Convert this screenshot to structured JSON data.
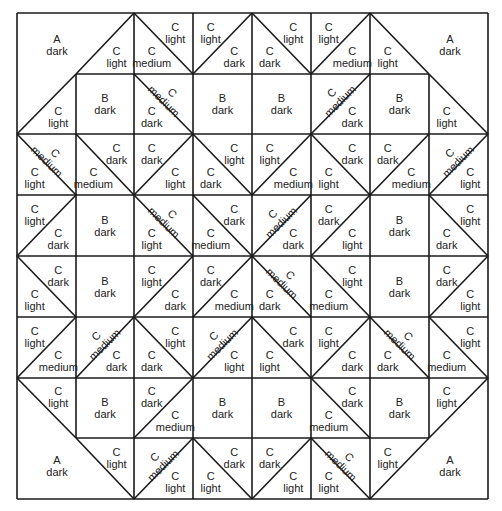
{
  "colors": {
    "line": "#1a1a1a",
    "text": "#222222",
    "background": "#ffffff"
  },
  "grid": {
    "cols": [
      17,
      76,
      134,
      193,
      252,
      311,
      370,
      429,
      488
    ],
    "rows": [
      13,
      74,
      134,
      195,
      256,
      317,
      378,
      438,
      499
    ]
  },
  "corners": [
    {
      "name": "top-left",
      "patch": "A",
      "shade": "dark",
      "x": 57,
      "y": 45
    },
    {
      "name": "top-right",
      "patch": "A",
      "shade": "dark",
      "x": 450,
      "y": 45
    },
    {
      "name": "bottom-left",
      "patch": "A",
      "shade": "dark",
      "x": 57,
      "y": 466
    },
    {
      "name": "bottom-right",
      "patch": "A",
      "shade": "dark",
      "x": 450,
      "y": 466
    }
  ],
  "cells": [
    {
      "r": 0,
      "c": 1,
      "diag": "/",
      "outer": true,
      "labels": [
        {
          "pos": "br",
          "shade": "light"
        }
      ]
    },
    {
      "r": 0,
      "c": 2,
      "diag": "\\",
      "labels": [
        {
          "pos": "tr",
          "shade": "light"
        },
        {
          "pos": "bl",
          "shade": "medium"
        }
      ]
    },
    {
      "r": 0,
      "c": 3,
      "diag": "/",
      "labels": [
        {
          "pos": "tl",
          "shade": "light"
        },
        {
          "pos": "br",
          "shade": "dark"
        }
      ]
    },
    {
      "r": 0,
      "c": 4,
      "diag": "\\",
      "labels": [
        {
          "pos": "tr",
          "shade": "light"
        },
        {
          "pos": "bl",
          "shade": "dark"
        }
      ]
    },
    {
      "r": 0,
      "c": 5,
      "diag": "/",
      "labels": [
        {
          "pos": "tl",
          "shade": "light"
        },
        {
          "pos": "br",
          "shade": "medium"
        }
      ]
    },
    {
      "r": 0,
      "c": 6,
      "diag": "\\",
      "outer": true,
      "labels": [
        {
          "pos": "bl",
          "shade": "light"
        }
      ]
    },
    {
      "r": 1,
      "c": 0,
      "diag": "/",
      "outer": true,
      "labels": [
        {
          "pos": "br",
          "shade": "light"
        }
      ]
    },
    {
      "r": 1,
      "c": 1,
      "square": "B",
      "shade": "dark"
    },
    {
      "r": 1,
      "c": 2,
      "diag": "\\",
      "labels": [
        {
          "pos": "tr",
          "shade": "medium",
          "rot": true
        },
        {
          "pos": "bl",
          "shade": "dark"
        }
      ]
    },
    {
      "r": 1,
      "c": 3,
      "square": "B",
      "shade": "dark"
    },
    {
      "r": 1,
      "c": 4,
      "square": "B",
      "shade": "dark"
    },
    {
      "r": 1,
      "c": 5,
      "diag": "/",
      "labels": [
        {
          "pos": "tl",
          "shade": "medium",
          "rot": true
        },
        {
          "pos": "br",
          "shade": "dark"
        }
      ]
    },
    {
      "r": 1,
      "c": 6,
      "square": "B",
      "shade": "dark"
    },
    {
      "r": 1,
      "c": 7,
      "diag": "\\",
      "outer": true,
      "labels": [
        {
          "pos": "bl",
          "shade": "light"
        }
      ]
    },
    {
      "r": 2,
      "c": 0,
      "diag": "\\",
      "labels": [
        {
          "pos": "tr",
          "shade": "medium",
          "rot": true
        },
        {
          "pos": "bl",
          "shade": "light"
        }
      ]
    },
    {
      "r": 2,
      "c": 1,
      "diag": "\\",
      "labels": [
        {
          "pos": "tr",
          "shade": "dark"
        },
        {
          "pos": "bl",
          "shade": "medium"
        }
      ]
    },
    {
      "r": 2,
      "c": 2,
      "diag": "/",
      "labels": [
        {
          "pos": "tl",
          "shade": "dark"
        },
        {
          "pos": "br",
          "shade": "light"
        }
      ]
    },
    {
      "r": 2,
      "c": 3,
      "diag": "\\",
      "labels": [
        {
          "pos": "tr",
          "shade": "light"
        },
        {
          "pos": "bl",
          "shade": "dark"
        }
      ]
    },
    {
      "r": 2,
      "c": 4,
      "diag": "/",
      "labels": [
        {
          "pos": "tl",
          "shade": "light"
        },
        {
          "pos": "br",
          "shade": "medium"
        }
      ]
    },
    {
      "r": 2,
      "c": 5,
      "diag": "\\",
      "labels": [
        {
          "pos": "tr",
          "shade": "dark"
        },
        {
          "pos": "bl",
          "shade": "light"
        }
      ]
    },
    {
      "r": 2,
      "c": 6,
      "diag": "/",
      "labels": [
        {
          "pos": "tl",
          "shade": "dark"
        },
        {
          "pos": "br",
          "shade": "medium"
        }
      ]
    },
    {
      "r": 2,
      "c": 7,
      "diag": "/",
      "labels": [
        {
          "pos": "tl",
          "shade": "medium",
          "rot": true
        },
        {
          "pos": "br",
          "shade": "light"
        }
      ]
    },
    {
      "r": 3,
      "c": 0,
      "diag": "/",
      "labels": [
        {
          "pos": "tl",
          "shade": "light"
        },
        {
          "pos": "br",
          "shade": "dark"
        }
      ]
    },
    {
      "r": 3,
      "c": 1,
      "square": "B",
      "shade": "dark"
    },
    {
      "r": 3,
      "c": 2,
      "diag": "\\",
      "labels": [
        {
          "pos": "tr",
          "shade": "medium",
          "rot": true
        },
        {
          "pos": "bl",
          "shade": "light"
        }
      ]
    },
    {
      "r": 3,
      "c": 3,
      "diag": "\\",
      "labels": [
        {
          "pos": "tr",
          "shade": "dark"
        },
        {
          "pos": "bl",
          "shade": "medium"
        }
      ]
    },
    {
      "r": 3,
      "c": 4,
      "diag": "/",
      "labels": [
        {
          "pos": "tl",
          "shade": "medium",
          "rot": true
        },
        {
          "pos": "br",
          "shade": "dark"
        }
      ]
    },
    {
      "r": 3,
      "c": 5,
      "diag": "/",
      "labels": [
        {
          "pos": "tl",
          "shade": "dark"
        },
        {
          "pos": "br",
          "shade": "light"
        }
      ]
    },
    {
      "r": 3,
      "c": 6,
      "square": "B",
      "shade": "dark"
    },
    {
      "r": 3,
      "c": 7,
      "diag": "\\",
      "labels": [
        {
          "pos": "tr",
          "shade": "light"
        },
        {
          "pos": "bl",
          "shade": "dark"
        }
      ]
    },
    {
      "r": 4,
      "c": 0,
      "diag": "\\",
      "labels": [
        {
          "pos": "tr",
          "shade": "dark"
        },
        {
          "pos": "bl",
          "shade": "light"
        }
      ]
    },
    {
      "r": 4,
      "c": 1,
      "square": "B",
      "shade": "dark"
    },
    {
      "r": 4,
      "c": 2,
      "diag": "/",
      "labels": [
        {
          "pos": "tl",
          "shade": "light"
        },
        {
          "pos": "br",
          "shade": "dark"
        }
      ]
    },
    {
      "r": 4,
      "c": 3,
      "diag": "/",
      "labels": [
        {
          "pos": "tl",
          "shade": "dark"
        },
        {
          "pos": "br",
          "shade": "medium"
        }
      ]
    },
    {
      "r": 4,
      "c": 4,
      "diag": "\\",
      "labels": [
        {
          "pos": "tr",
          "shade": "medium",
          "rot": true
        },
        {
          "pos": "bl",
          "shade": "dark"
        }
      ]
    },
    {
      "r": 4,
      "c": 5,
      "diag": "\\",
      "labels": [
        {
          "pos": "tr",
          "shade": "light"
        },
        {
          "pos": "bl",
          "shade": "medium"
        }
      ]
    },
    {
      "r": 4,
      "c": 6,
      "square": "B",
      "shade": "dark"
    },
    {
      "r": 4,
      "c": 7,
      "diag": "/",
      "labels": [
        {
          "pos": "tl",
          "shade": "dark"
        },
        {
          "pos": "br",
          "shade": "light"
        }
      ]
    },
    {
      "r": 5,
      "c": 0,
      "diag": "/",
      "labels": [
        {
          "pos": "tl",
          "shade": "light"
        },
        {
          "pos": "br",
          "shade": "medium"
        }
      ]
    },
    {
      "r": 5,
      "c": 1,
      "diag": "/",
      "labels": [
        {
          "pos": "tl",
          "shade": "medium",
          "rot": true
        },
        {
          "pos": "br",
          "shade": "dark"
        }
      ]
    },
    {
      "r": 5,
      "c": 2,
      "diag": "\\",
      "labels": [
        {
          "pos": "tr",
          "shade": "light"
        },
        {
          "pos": "bl",
          "shade": "dark"
        }
      ]
    },
    {
      "r": 5,
      "c": 3,
      "diag": "/",
      "labels": [
        {
          "pos": "tl",
          "shade": "medium",
          "rot": true
        },
        {
          "pos": "br",
          "shade": "light"
        }
      ]
    },
    {
      "r": 5,
      "c": 4,
      "diag": "\\",
      "labels": [
        {
          "pos": "tr",
          "shade": "dark"
        },
        {
          "pos": "bl",
          "shade": "light"
        }
      ]
    },
    {
      "r": 5,
      "c": 5,
      "diag": "/",
      "labels": [
        {
          "pos": "tl",
          "shade": "light"
        },
        {
          "pos": "br",
          "shade": "dark"
        }
      ]
    },
    {
      "r": 5,
      "c": 6,
      "diag": "\\",
      "labels": [
        {
          "pos": "tr",
          "shade": "medium",
          "rot": true
        },
        {
          "pos": "bl",
          "shade": "dark"
        }
      ]
    },
    {
      "r": 5,
      "c": 7,
      "diag": "\\",
      "labels": [
        {
          "pos": "tr",
          "shade": "light"
        },
        {
          "pos": "bl",
          "shade": "medium"
        }
      ]
    },
    {
      "r": 6,
      "c": 0,
      "diag": "\\",
      "outer": true,
      "labels": [
        {
          "pos": "tr",
          "shade": "light"
        }
      ]
    },
    {
      "r": 6,
      "c": 1,
      "square": "B",
      "shade": "dark"
    },
    {
      "r": 6,
      "c": 2,
      "diag": "/",
      "labels": [
        {
          "pos": "tl",
          "shade": "dark"
        },
        {
          "pos": "br",
          "shade": "medium"
        }
      ]
    },
    {
      "r": 6,
      "c": 3,
      "square": "B",
      "shade": "dark"
    },
    {
      "r": 6,
      "c": 4,
      "square": "B",
      "shade": "dark"
    },
    {
      "r": 6,
      "c": 5,
      "diag": "\\",
      "labels": [
        {
          "pos": "tr",
          "shade": "dark"
        },
        {
          "pos": "bl",
          "shade": "medium"
        }
      ]
    },
    {
      "r": 6,
      "c": 6,
      "square": "B",
      "shade": "dark"
    },
    {
      "r": 6,
      "c": 7,
      "diag": "/",
      "outer": true,
      "labels": [
        {
          "pos": "tl",
          "shade": "light"
        }
      ]
    },
    {
      "r": 7,
      "c": 1,
      "diag": "\\",
      "outer": true,
      "labels": [
        {
          "pos": "tr",
          "shade": "light"
        }
      ]
    },
    {
      "r": 7,
      "c": 2,
      "diag": "/",
      "labels": [
        {
          "pos": "tl",
          "shade": "medium",
          "rot": true
        },
        {
          "pos": "br",
          "shade": "light"
        }
      ]
    },
    {
      "r": 7,
      "c": 3,
      "diag": "\\",
      "labels": [
        {
          "pos": "tr",
          "shade": "dark"
        },
        {
          "pos": "bl",
          "shade": "light"
        }
      ]
    },
    {
      "r": 7,
      "c": 4,
      "diag": "/",
      "labels": [
        {
          "pos": "tl",
          "shade": "dark"
        },
        {
          "pos": "br",
          "shade": "light"
        }
      ]
    },
    {
      "r": 7,
      "c": 5,
      "diag": "\\",
      "labels": [
        {
          "pos": "tr",
          "shade": "medium",
          "rot": true
        },
        {
          "pos": "bl",
          "shade": "light"
        }
      ]
    },
    {
      "r": 7,
      "c": 6,
      "diag": "/",
      "outer": true,
      "labels": [
        {
          "pos": "tl",
          "shade": "light"
        }
      ]
    }
  ],
  "patch_letter": "C"
}
